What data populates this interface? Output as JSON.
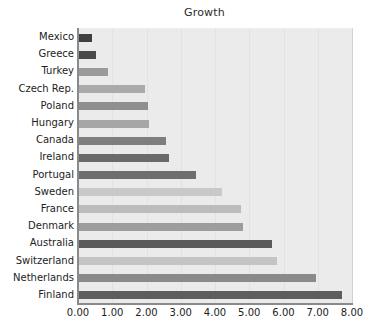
{
  "chart_data": {
    "type": "bar",
    "orientation": "horizontal",
    "title": "Growth",
    "xlabel": "",
    "ylabel": "",
    "xlim": [
      0,
      8
    ],
    "xticks": [
      "0.00",
      "1.00",
      "2.00",
      "3.00",
      "4.00",
      "5.00",
      "6.00",
      "7.00",
      "8.00"
    ],
    "xtick_values": [
      0,
      1,
      2,
      3,
      4,
      5,
      6,
      7,
      8
    ],
    "grid": true,
    "legend": "none",
    "plot_background": "#ebebeb",
    "categories": [
      "Mexico",
      "Greece",
      "Turkey",
      "Czech Rep.",
      "Poland",
      "Hungary",
      "Canada",
      "Ireland",
      "Portugal",
      "Sweden",
      "France",
      "Denmark",
      "Australia",
      "Switzerland",
      "Netherlands",
      "Finland"
    ],
    "values": [
      0.4,
      0.52,
      0.89,
      1.97,
      2.03,
      2.07,
      2.58,
      2.65,
      3.45,
      4.2,
      4.75,
      4.82,
      5.65,
      5.82,
      6.95,
      7.7
    ],
    "bar_colors": [
      "#3f3f3f",
      "#494949",
      "#9a9a9a",
      "#aaaaaa",
      "#8f8f8f",
      "#a6a6a6",
      "#7e7e7e",
      "#6a6a6a",
      "#6e6e6e",
      "#c9c9c9",
      "#bcbcbc",
      "#9d9d9d",
      "#5a5a5a",
      "#c4c4c4",
      "#8a8a8a",
      "#5e5e5e"
    ]
  }
}
